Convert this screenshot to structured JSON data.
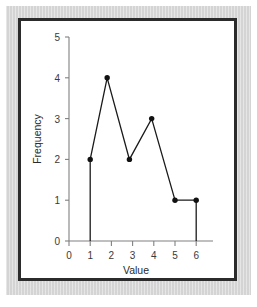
{
  "figure": {
    "frame_color": "#2b2b2b",
    "mat_color": "#d8d8d8",
    "plate_color": "#ffffff"
  },
  "chart_data": {
    "type": "line",
    "title": "",
    "xlabel": "Value",
    "ylabel": "Frequency",
    "xlim": [
      0,
      6.6
    ],
    "ylim": [
      0,
      5
    ],
    "xticks": [
      0,
      1,
      2,
      3,
      4,
      5,
      6
    ],
    "xtick_labels": [
      "0",
      "1",
      "2",
      "3",
      "4",
      "5",
      "6"
    ],
    "yticks": [
      0,
      1,
      2,
      3,
      4,
      5
    ],
    "ytick_labels": [
      "0",
      "1",
      "2",
      "3",
      "4",
      "5"
    ],
    "grid": false,
    "legend": false,
    "marker": "filled-circle",
    "line_color": "#1a1a1a",
    "marker_color": "#111111",
    "axis_color": "#808080",
    "x": [
      1.0,
      1.8,
      2.85,
      3.9,
      5.0,
      6.0
    ],
    "y": [
      2,
      4,
      2,
      3,
      1,
      1
    ],
    "points": [
      {
        "x": 1.0,
        "y": 2
      },
      {
        "x": 1.8,
        "y": 4
      },
      {
        "x": 2.85,
        "y": 2
      },
      {
        "x": 3.9,
        "y": 3
      },
      {
        "x": 5.0,
        "y": 1
      },
      {
        "x": 6.0,
        "y": 1
      }
    ],
    "drop_lines": [
      {
        "x": 1.0,
        "y_top": 2,
        "y_bottom": 0
      },
      {
        "x": 6.0,
        "y_top": 1,
        "y_bottom": 0
      }
    ],
    "annotations": []
  }
}
